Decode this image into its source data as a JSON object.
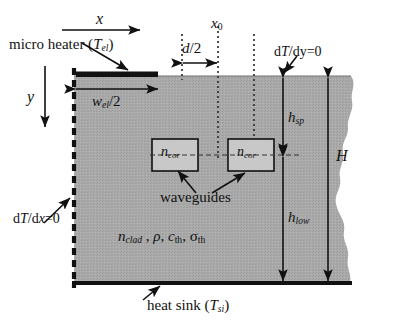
{
  "figure": {
    "colors": {
      "substrate_fill": "#a8a8a8",
      "heater_fill": "#111111",
      "line": "#111111",
      "background": "#ffffff",
      "box_fill": "#c4c4c4"
    }
  },
  "axes": {
    "x_axis_label": "x",
    "y_axis_label": "y"
  },
  "labels": {
    "micro_heater": "micro heater (",
    "micro_heater_sym": "T",
    "micro_heater_sub": "el",
    "micro_heater_close": ")",
    "heat_sink": "heat sink (",
    "heat_sink_sym": "T",
    "heat_sink_sub": "si",
    "heat_sink_close": ")",
    "waveguides": "waveguides",
    "x0": "x",
    "x0_sub": "0",
    "d_half_num": "d",
    "d_half_den": "/2",
    "w_el_sym": "w",
    "w_el_sub": "el",
    "w_el_den": "/2",
    "h_sp_sym": "h",
    "h_sp_sub": "sp",
    "h_low_sym": "h",
    "h_low_sub": "low",
    "H_sym": "H",
    "n_core_sym": "n",
    "n_core_sub": "cor",
    "bc_top": "d",
    "bc_top_T": "T",
    "bc_top_rest": "/dy=0",
    "bc_left": "d",
    "bc_left_T": "T",
    "bc_left_x": "x",
    "bc_left_rest": "=0",
    "bc_left_slash": "/d",
    "material_n": "n",
    "material_n_sub": "clad",
    "material_sep1": " , ",
    "material_rho": "ρ",
    "material_comma1": ", ",
    "material_c": "c",
    "material_c_sub": "th",
    "material_comma2": ", ",
    "material_sigma": "σ",
    "material_sigma_sub": "th"
  },
  "regions": {
    "cladding_name": "cladding region",
    "waveguide_left_name": "left waveguide core",
    "waveguide_right_name": "right waveguide core"
  }
}
